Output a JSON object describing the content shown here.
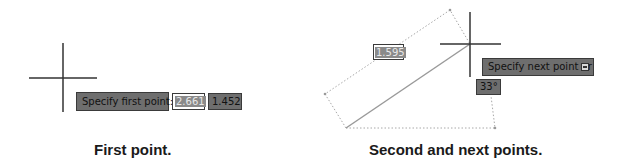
{
  "panel_first": {
    "prompt": "Specify first point:",
    "x_value": "2.661",
    "y_value": "1.452",
    "caption": "First point."
  },
  "panel_next": {
    "length_value": "1.595",
    "prompt": "Specify next point or",
    "angle_value": "33°",
    "options_icon": "dropdown-arrow-icon",
    "caption": "Second and next points."
  },
  "colors": {
    "tooltip_bg": "#6e6e6e",
    "tooltip_border": "#3a3a3a",
    "crosshair": "#333333",
    "line": "#9a9a9a",
    "dotted": "#a8a8a8"
  }
}
